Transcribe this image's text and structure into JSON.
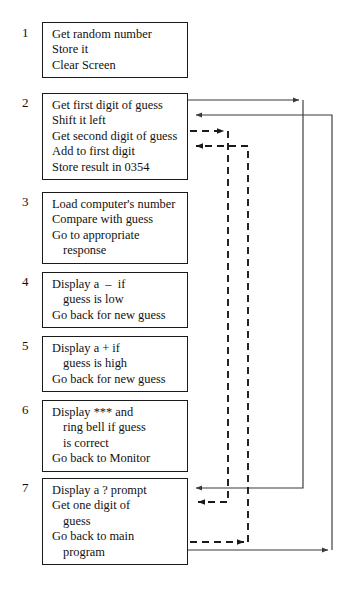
{
  "diagram": {
    "colors": {
      "box_border": "#1a1a1a",
      "text": "#111111",
      "solid_connector": "#3a3a3a",
      "dashed_connector": "#1a1a1a",
      "background": "#ffffff"
    },
    "steps": [
      {
        "index": "1",
        "top": 22,
        "lines": [
          {
            "text": "Get random number",
            "indent": false
          },
          {
            "text": "Store it",
            "indent": false
          },
          {
            "text": "Clear Screen",
            "indent": false
          }
        ]
      },
      {
        "index": "2",
        "top": 93,
        "lines": [
          {
            "text": "Get first digit of guess",
            "indent": false
          },
          {
            "text": "Shift it left",
            "indent": false
          },
          {
            "text": "Get second digit of guess",
            "indent": false
          },
          {
            "text": "Add to first digit",
            "indent": false
          },
          {
            "text": "Store result in 0354",
            "indent": false
          }
        ]
      },
      {
        "index": "3",
        "top": 192,
        "lines": [
          {
            "text": "Load computer's number",
            "indent": false
          },
          {
            "text": "Compare with guess",
            "indent": false
          },
          {
            "text": "Go to appropriate",
            "indent": false
          },
          {
            "text": "response",
            "indent": true
          }
        ]
      },
      {
        "index": "4",
        "top": 272,
        "lines": [
          {
            "text": "Display a  –  if",
            "indent": false
          },
          {
            "text": "guess is low",
            "indent": true
          },
          {
            "text": "Go back for new guess",
            "indent": false
          }
        ]
      },
      {
        "index": "5",
        "top": 336,
        "lines": [
          {
            "text": "Display a + if",
            "indent": false
          },
          {
            "text": "guess is high",
            "indent": true
          },
          {
            "text": "Go back for new guess",
            "indent": false
          }
        ]
      },
      {
        "index": "6",
        "top": 400,
        "lines": [
          {
            "text": "Display *** and",
            "indent": false
          },
          {
            "text": "ring bell if guess",
            "indent": true
          },
          {
            "text": "is correct",
            "indent": true
          },
          {
            "text": "Go back to Monitor",
            "indent": false
          }
        ]
      },
      {
        "index": "7",
        "top": 478,
        "lines": [
          {
            "text": "Display a ? prompt",
            "indent": false
          },
          {
            "text": "Get one digit of",
            "indent": false
          },
          {
            "text": "guess",
            "indent": true
          },
          {
            "text": "Go back to main",
            "indent": false
          },
          {
            "text": "program",
            "indent": true
          }
        ]
      }
    ],
    "connectors": [
      {
        "name": "call-prompt-routine",
        "style": "solid",
        "from": "step-2 line 1 (Get first digit of guess)",
        "to": "step-7 line 1 (Display a ? prompt)",
        "arrows": [
          "at x=303 pointing right",
          "at box 7 pointing left"
        ]
      },
      {
        "name": "return-from-prompt-routine",
        "style": "solid",
        "from": "step-7 bottom (program)",
        "to": "step-2 line 2 (Shift it left)",
        "arrows": [
          "at x=332 pointing right",
          "at box 2 pointing left"
        ]
      },
      {
        "name": "call-second-digit-routine",
        "style": "dashed",
        "from": "step-2 line 3 (Get second digit of guess)",
        "to": "step-7 line 2 (Get one digit of guess)",
        "arrows": [
          "at x=228 pointing right",
          "at box 7 pointing left"
        ]
      },
      {
        "name": "return-second-digit-routine",
        "style": "dashed",
        "from": "step-7 line 4 (Go back to main program)",
        "to": "step-2 line 4 (Add to first digit)",
        "arrows": [
          "at x=248 pointing right",
          "at box 2 pointing left"
        ]
      }
    ]
  }
}
